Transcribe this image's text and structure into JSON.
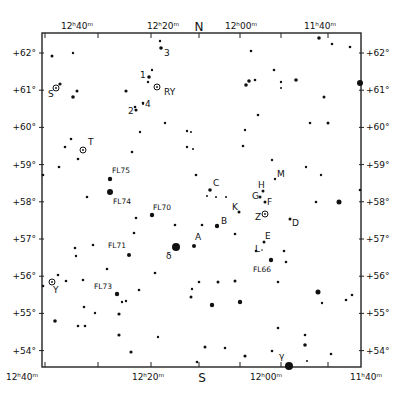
{
  "chart_data": {
    "type": "scatter",
    "compass": {
      "top": "N",
      "bottom": "S"
    },
    "x_axis": {
      "label": "Right Ascension",
      "ticks_top": [
        "12h40m",
        "12h20m",
        "12h00m",
        "11h40m"
      ],
      "ticks_bottom": [
        "12h40m",
        "12h20m",
        "12h00m",
        "11h40m"
      ],
      "range": [
        "12h40m",
        "11h40m"
      ]
    },
    "y_axis": {
      "label": "Declination",
      "ticks_left": [
        "+62°",
        "+61°",
        "+60°",
        "+59°",
        "+58°",
        "+57°",
        "+56°",
        "+55°",
        "+54°"
      ],
      "ticks_right": [
        "+62°",
        "+61°",
        "+60°",
        "+59°",
        "+58°",
        "+57°",
        "+56°",
        "+55°",
        "+54°"
      ],
      "range": [
        53.6,
        62.5
      ]
    },
    "grid": false,
    "frame": {
      "left": 42,
      "top": 33,
      "right": 361,
      "bottom": 367
    },
    "labels": {
      "tl_ra": "12",
      "h": "H",
      "m": "M"
    },
    "stars": [
      {
        "x": 160,
        "y": 41,
        "r": 1.2
      },
      {
        "x": 161,
        "y": 48,
        "r": 1.8,
        "label": "3",
        "lx": 164,
        "ly": 56
      },
      {
        "x": 319,
        "y": 38,
        "r": 1.8
      },
      {
        "x": 332,
        "y": 44,
        "r": 1.3
      },
      {
        "x": 350,
        "y": 47,
        "r": 1.3
      },
      {
        "x": 52,
        "y": 56,
        "r": 1.5
      },
      {
        "x": 73,
        "y": 53,
        "r": 1.2
      },
      {
        "x": 251,
        "y": 51,
        "r": 1.3
      },
      {
        "x": 152,
        "y": 70,
        "r": 1.2
      },
      {
        "x": 149,
        "y": 77,
        "r": 1.8,
        "label": "1",
        "lx": 140,
        "ly": 78
      },
      {
        "x": 148,
        "y": 82,
        "r": 1.2
      },
      {
        "x": 60,
        "y": 84,
        "r": 1.6
      },
      {
        "x": 77,
        "y": 91,
        "r": 1.5
      },
      {
        "x": 73,
        "y": 97,
        "r": 1.8
      },
      {
        "x": 126,
        "y": 91,
        "r": 1.6
      },
      {
        "x": 255,
        "y": 80,
        "r": 1.3
      },
      {
        "x": 249,
        "y": 81,
        "r": 1.8
      },
      {
        "x": 246,
        "y": 85,
        "r": 1.8
      },
      {
        "x": 274,
        "y": 70,
        "r": 1.3
      },
      {
        "x": 281,
        "y": 82,
        "r": 1.2
      },
      {
        "x": 281,
        "y": 88,
        "r": 1.0
      },
      {
        "x": 296,
        "y": 80,
        "r": 1.8
      },
      {
        "x": 360,
        "y": 83,
        "r": 3.0
      },
      {
        "x": 324,
        "y": 97,
        "r": 1.5
      },
      {
        "x": 143,
        "y": 103,
        "r": 1.3
      },
      {
        "x": 136,
        "y": 110,
        "r": 1.6
      },
      {
        "x": 258,
        "y": 115,
        "r": 1.3
      },
      {
        "x": 245,
        "y": 130,
        "r": 1.2
      },
      {
        "x": 310,
        "y": 123,
        "r": 1.3
      },
      {
        "x": 328,
        "y": 123,
        "r": 1.5
      },
      {
        "x": 165,
        "y": 123,
        "r": 1.2
      },
      {
        "x": 140,
        "y": 132,
        "r": 1.2
      },
      {
        "x": 187,
        "y": 131,
        "r": 1.2
      },
      {
        "x": 191,
        "y": 132,
        "r": 1.0
      },
      {
        "x": 71,
        "y": 139,
        "r": 1.3
      },
      {
        "x": 65,
        "y": 147,
        "r": 1.3
      },
      {
        "x": 78,
        "y": 159,
        "r": 1.3
      },
      {
        "x": 59,
        "y": 167,
        "r": 1.3
      },
      {
        "x": 43,
        "y": 175,
        "r": 1.3
      },
      {
        "x": 132,
        "y": 152,
        "r": 1.3
      },
      {
        "x": 187,
        "y": 147,
        "r": 1.2
      },
      {
        "x": 193,
        "y": 149,
        "r": 1.0
      },
      {
        "x": 243,
        "y": 146,
        "r": 1.3
      },
      {
        "x": 272,
        "y": 160,
        "r": 1.2
      },
      {
        "x": 306,
        "y": 167,
        "r": 1.2
      },
      {
        "x": 321,
        "y": 175,
        "r": 1.2
      },
      {
        "x": 110,
        "y": 179,
        "r": 2.2,
        "label": "FL75",
        "lx": 112,
        "ly": 173
      },
      {
        "x": 110,
        "y": 192,
        "r": 3.0,
        "label": "FL74",
        "lx": 113,
        "ly": 204
      },
      {
        "x": 87,
        "y": 197,
        "r": 1.3
      },
      {
        "x": 196,
        "y": 175,
        "r": 1.3
      },
      {
        "x": 210,
        "y": 190,
        "r": 1.8,
        "label": "C",
        "lx": 213,
        "ly": 186
      },
      {
        "x": 207,
        "y": 196,
        "r": 1.0
      },
      {
        "x": 216,
        "y": 197,
        "r": 1.0
      },
      {
        "x": 226,
        "y": 197,
        "r": 1.0
      },
      {
        "x": 263,
        "y": 191,
        "r": 1.5,
        "label": "H",
        "lx": 258,
        "ly": 188
      },
      {
        "x": 275,
        "y": 179,
        "r": 1.2,
        "label": "M",
        "lx": 277,
        "ly": 177
      },
      {
        "x": 260,
        "y": 197,
        "r": 1.5,
        "label": "G",
        "lx": 252,
        "ly": 199
      },
      {
        "x": 265,
        "y": 202,
        "r": 1.5,
        "label": "F",
        "lx": 267,
        "ly": 205
      },
      {
        "x": 316,
        "y": 202,
        "r": 1.3
      },
      {
        "x": 339,
        "y": 202,
        "r": 2.5
      },
      {
        "x": 360,
        "y": 190,
        "r": 1.3
      },
      {
        "x": 152,
        "y": 215,
        "r": 2.2,
        "label": "FL70",
        "lx": 153,
        "ly": 210
      },
      {
        "x": 136,
        "y": 218,
        "r": 1.3
      },
      {
        "x": 239,
        "y": 212,
        "r": 1.5,
        "label": "K",
        "lx": 232,
        "ly": 210
      },
      {
        "x": 290,
        "y": 219,
        "r": 1.5,
        "label": "D",
        "lx": 292,
        "ly": 226
      },
      {
        "x": 202,
        "y": 225,
        "r": 1.3
      },
      {
        "x": 217,
        "y": 226,
        "r": 2.2,
        "label": "B",
        "lx": 221,
        "ly": 224
      },
      {
        "x": 235,
        "y": 234,
        "r": 1.3
      },
      {
        "x": 264,
        "y": 242,
        "r": 1.5,
        "label": "E",
        "lx": 265,
        "ly": 239
      },
      {
        "x": 262,
        "y": 250,
        "r": 0.8,
        "label": "L",
        "lx": 255,
        "ly": 252
      },
      {
        "x": 134,
        "y": 233,
        "r": 1.3
      },
      {
        "x": 175,
        "y": 225,
        "r": 1.3
      },
      {
        "x": 176,
        "y": 247,
        "r": 4.0,
        "label": "δ",
        "lx": 166,
        "ly": 259
      },
      {
        "x": 194,
        "y": 246,
        "r": 2.0,
        "label": "A",
        "lx": 195,
        "ly": 240
      },
      {
        "x": 75,
        "y": 248,
        "r": 1.3
      },
      {
        "x": 93,
        "y": 245,
        "r": 1.3
      },
      {
        "x": 76,
        "y": 256,
        "r": 1.2
      },
      {
        "x": 129,
        "y": 255,
        "r": 2.0,
        "label": "FL71",
        "lx": 108,
        "ly": 248
      },
      {
        "x": 271,
        "y": 260,
        "r": 2.2,
        "label": "FL66",
        "lx": 253,
        "ly": 272
      },
      {
        "x": 256,
        "y": 251,
        "r": 1.3
      },
      {
        "x": 284,
        "y": 251,
        "r": 1.3
      },
      {
        "x": 286,
        "y": 262,
        "r": 1.3
      },
      {
        "x": 278,
        "y": 282,
        "r": 1.3
      },
      {
        "x": 107,
        "y": 269,
        "r": 1.3
      },
      {
        "x": 83,
        "y": 280,
        "r": 1.3
      },
      {
        "x": 58,
        "y": 275,
        "r": 1.3
      },
      {
        "x": 66,
        "y": 281,
        "r": 1.3
      },
      {
        "x": 43,
        "y": 286,
        "r": 1.3
      },
      {
        "x": 155,
        "y": 273,
        "r": 1.3
      },
      {
        "x": 199,
        "y": 282,
        "r": 1.3
      },
      {
        "x": 117,
        "y": 294,
        "r": 2.2,
        "label": "FL73",
        "lx": 94,
        "ly": 289
      },
      {
        "x": 139,
        "y": 290,
        "r": 1.3
      },
      {
        "x": 122,
        "y": 302,
        "r": 1.2
      },
      {
        "x": 126,
        "y": 301,
        "r": 1.2
      },
      {
        "x": 192,
        "y": 289,
        "r": 1.2
      },
      {
        "x": 191,
        "y": 297,
        "r": 1.5
      },
      {
        "x": 218,
        "y": 282,
        "r": 1.5
      },
      {
        "x": 235,
        "y": 281,
        "r": 1.5
      },
      {
        "x": 318,
        "y": 292,
        "r": 2.5
      },
      {
        "x": 322,
        "y": 303,
        "r": 1.2
      },
      {
        "x": 346,
        "y": 300,
        "r": 1.3
      },
      {
        "x": 352,
        "y": 295,
        "r": 1.3
      },
      {
        "x": 240,
        "y": 302,
        "r": 2.2
      },
      {
        "x": 84,
        "y": 307,
        "r": 1.3
      },
      {
        "x": 55,
        "y": 321,
        "r": 1.8
      },
      {
        "x": 95,
        "y": 313,
        "r": 1.2
      },
      {
        "x": 85,
        "y": 326,
        "r": 1.3
      },
      {
        "x": 119,
        "y": 314,
        "r": 1.6
      },
      {
        "x": 119,
        "y": 335,
        "r": 1.6
      },
      {
        "x": 158,
        "y": 337,
        "r": 1.2
      },
      {
        "x": 78,
        "y": 326,
        "r": 1.3
      },
      {
        "x": 131,
        "y": 352,
        "r": 1.6
      },
      {
        "x": 212,
        "y": 305,
        "r": 2.2
      },
      {
        "x": 278,
        "y": 328,
        "r": 1.3
      },
      {
        "x": 205,
        "y": 347,
        "r": 1.5
      },
      {
        "x": 225,
        "y": 348,
        "r": 1.3
      },
      {
        "x": 245,
        "y": 356,
        "r": 1.6
      },
      {
        "x": 272,
        "y": 351,
        "r": 1.3
      },
      {
        "x": 305,
        "y": 345,
        "r": 1.8
      },
      {
        "x": 305,
        "y": 335,
        "r": 1.3
      },
      {
        "x": 307,
        "y": 361,
        "r": 1.0
      },
      {
        "x": 331,
        "y": 354,
        "r": 1.3
      },
      {
        "x": 197,
        "y": 362,
        "r": 1.3
      },
      {
        "x": 289,
        "y": 366,
        "r": 4.0,
        "label": "γ",
        "lx": 279,
        "ly": 359
      }
    ],
    "variable_stars": [
      {
        "x": 56,
        "y": 88,
        "label": "S",
        "lx": 48,
        "ly": 97
      },
      {
        "x": 157,
        "y": 87,
        "label": "RY",
        "lx": 164,
        "ly": 95
      },
      {
        "x": 83,
        "y": 150,
        "label": "T",
        "lx": 88,
        "ly": 145
      },
      {
        "x": 265,
        "y": 214,
        "label": "Z",
        "lx": 255,
        "ly": 220
      },
      {
        "x": 52,
        "y": 282,
        "label": "Y",
        "lx": 53,
        "ly": 293
      }
    ],
    "extra_labels": [
      {
        "text": "2",
        "x": 128,
        "y": 114
      },
      {
        "text": "4",
        "x": 145,
        "y": 107
      }
    ],
    "extra_dots": [
      {
        "x": 135,
        "y": 107,
        "r": 1.3
      },
      {
        "x": 143,
        "y": 104,
        "r": 1.0
      }
    ]
  }
}
